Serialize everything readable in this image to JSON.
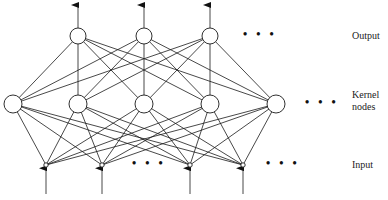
{
  "labels": {
    "output": "Output",
    "kernel_line1": "Kernel",
    "kernel_line2": "nodes",
    "input": "Input"
  },
  "ellipsis": "• • •",
  "layers": {
    "output": {
      "y": 36,
      "r": 8,
      "x": [
        78,
        144,
        210
      ]
    },
    "kernel": {
      "y": 104,
      "r": 9,
      "x": [
        13,
        78,
        144,
        210,
        276
      ]
    },
    "input": {
      "y": 165,
      "r": 2.2,
      "x": [
        46,
        102,
        190,
        243
      ]
    }
  },
  "colors": {
    "stroke": "#1a1a1a",
    "fill": "#ffffff"
  }
}
